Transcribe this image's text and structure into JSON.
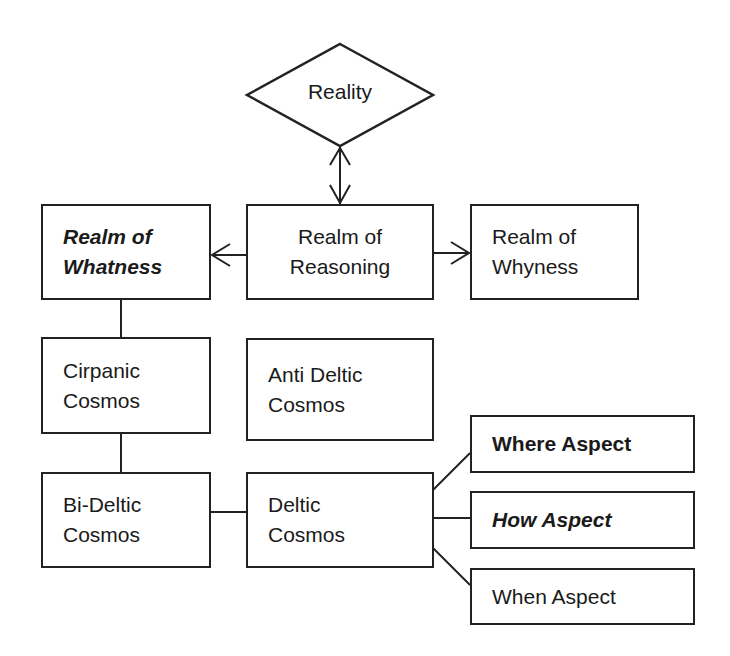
{
  "diagram": {
    "reality": "Reality",
    "realm_whatness": [
      "Realm of",
      "Whatness"
    ],
    "realm_reasoning": [
      "Realm of",
      "Reasoning"
    ],
    "realm_whyness": [
      "Realm of",
      "Whyness"
    ],
    "cirpanic": [
      "Cirpanic",
      "Cosmos"
    ],
    "anti_deltic": [
      "Anti Deltic",
      "Cosmos"
    ],
    "bi_deltic": [
      "Bi-Deltic",
      "Cosmos"
    ],
    "deltic": [
      "Deltic",
      "Cosmos"
    ],
    "where_aspect": "Where Aspect",
    "how_aspect": "How Aspect",
    "when_aspect": "When Aspect"
  }
}
